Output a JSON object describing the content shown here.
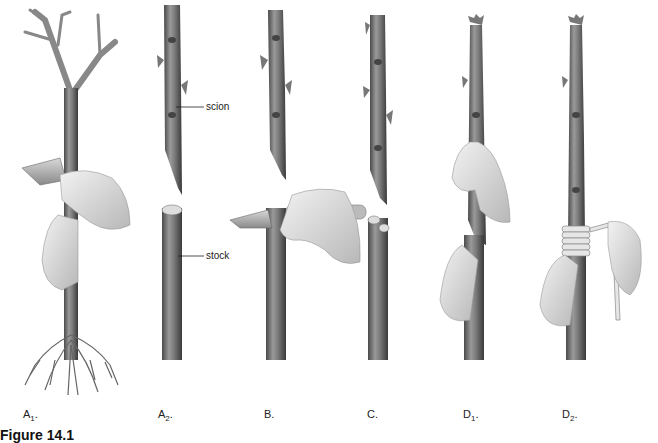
{
  "figure": {
    "caption_visible": "Figure 14.1",
    "callouts": {
      "scion": "scion",
      "stock": "stock"
    },
    "panels": [
      {
        "id": "A1",
        "letter": "A",
        "sub": "1",
        "suffix": ".",
        "description": "rooted stock with branches being cut with knife"
      },
      {
        "id": "A2",
        "letter": "A",
        "sub": "2",
        "suffix": ".",
        "description": "scion above cut stock"
      },
      {
        "id": "B",
        "letter": "B",
        "sub": "",
        "suffix": ".",
        "description": "knife making cut in stock"
      },
      {
        "id": "C",
        "letter": "C",
        "sub": "",
        "suffix": ".",
        "description": "scion with wedge cut above split stock"
      },
      {
        "id": "D1",
        "letter": "D",
        "sub": "1",
        "suffix": ".",
        "description": "scion inserted into stock by hand"
      },
      {
        "id": "D2",
        "letter": "D",
        "sub": "2",
        "suffix": ".",
        "description": "graft wrapped with tape"
      }
    ]
  }
}
